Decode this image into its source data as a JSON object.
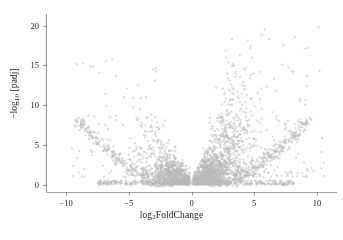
{
  "figure": {
    "background_color": "#ffffff",
    "point_color": "#b9b9b9",
    "axis_color": "#4d4d4d",
    "text_color": "#1a1a1a"
  },
  "chart_data": {
    "type": "scatter",
    "title": "",
    "subtitle": "",
    "xlabel_prefix": "log",
    "xlabel_sub": "2",
    "xlabel_suffix": "FoldChange",
    "xlabel": "log2FoldChange",
    "ylabel_prefix": "−log",
    "ylabel_sub": "10",
    "ylabel_suffix": " [padj]",
    "ylabel": "−log10 [padj]",
    "xlim": [
      -11.6,
      11.6
    ],
    "ylim": [
      -0.9,
      21.2
    ],
    "xticks": [
      -10,
      -5,
      0,
      5,
      10
    ],
    "xtick_labels": [
      "−10",
      "−5",
      "0",
      "5",
      "10"
    ],
    "yticks": [
      0,
      5,
      10,
      15,
      20
    ],
    "ytick_labels": [
      "0",
      "5",
      "10",
      "15",
      "20"
    ],
    "grid": false,
    "legend": "none",
    "point_radius": 1.15,
    "point_opacity": 0.5,
    "n_points": 4200,
    "series": [
      {
        "name": "genes",
        "color": "#b9b9b9",
        "clusters": [
          {
            "role": "core-left",
            "n": 780,
            "x_center": -1.05,
            "x_spread": 0.95,
            "x_min": -4.2,
            "x_max": -0.13,
            "y_mode": "core",
            "y_scale": 1.55,
            "y_max": 6.5
          },
          {
            "role": "core-right",
            "n": 880,
            "x_center": 1.05,
            "x_spread": 0.95,
            "x_min": 0.13,
            "x_max": 4.3,
            "y_mode": "core",
            "y_scale": 1.75,
            "y_max": 7.5
          },
          {
            "role": "plume-right",
            "n": 620,
            "x_center": 2.75,
            "x_spread": 1.25,
            "x_min": 0.9,
            "x_max": 6.4,
            "y_mode": "plume",
            "y_scale": 6.2,
            "y_max": 20.4
          },
          {
            "role": "plume-left",
            "n": 230,
            "x_center": -2.35,
            "x_spread": 1.15,
            "x_min": -6.0,
            "x_max": -0.8,
            "y_mode": "plume",
            "y_scale": 4.1,
            "y_max": 16.5
          },
          {
            "role": "arc-left",
            "n": 330,
            "x_min": -9.3,
            "x_max": -1.4,
            "y_mode": "arc",
            "arc_k": 0.105,
            "arc_jitter": 0.55
          },
          {
            "role": "arc-right",
            "n": 360,
            "x_min": 1.4,
            "x_max": 9.6,
            "y_mode": "arc",
            "arc_k": 0.098,
            "arc_jitter": 0.55
          },
          {
            "role": "sparse-hi-right",
            "n": 120,
            "x_min": 3.2,
            "x_max": 10.6,
            "y_mode": "sparse",
            "y_min": 1.0,
            "y_max": 19.8
          },
          {
            "role": "sparse-hi-left",
            "n": 75,
            "x_min": -9.8,
            "x_max": -2.6,
            "y_mode": "sparse",
            "y_min": 1.0,
            "y_max": 16.0
          },
          {
            "role": "baseline",
            "n": 420,
            "x_min": -7.5,
            "x_max": 8.2,
            "y_mode": "baseline",
            "y_max": 0.55
          }
        ]
      }
    ]
  }
}
